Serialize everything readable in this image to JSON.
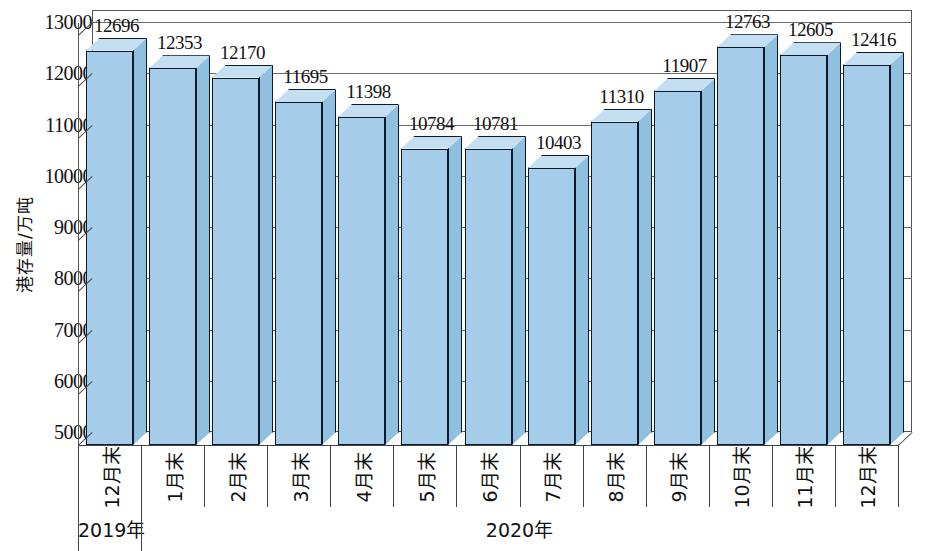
{
  "chart_data": {
    "type": "bar",
    "title": "",
    "xlabel": "",
    "ylabel": "港存量/万吨",
    "ylim": [
      5000,
      13000
    ],
    "ytick_step": 1000,
    "yticks": [
      "13000",
      "12000",
      "11000",
      "10000",
      "9000",
      "8000",
      "7000",
      "6000",
      "5000"
    ],
    "ytick_values": [
      13000,
      12000,
      11000,
      10000,
      9000,
      8000,
      7000,
      6000,
      5000
    ],
    "grid": true,
    "legend": null,
    "legend_position": "none",
    "style": "3d-column",
    "categories": [
      "12月末",
      "1月末",
      "2月末",
      "3月末",
      "4月末",
      "5月末",
      "6月末",
      "7月末",
      "8月末",
      "9月末",
      "10月末",
      "11月末",
      "12月末"
    ],
    "values": [
      12696,
      12353,
      12170,
      11695,
      11398,
      10784,
      10781,
      10403,
      11310,
      11907,
      12763,
      12605,
      12416
    ],
    "data_labels": [
      "12696",
      "12353",
      "12170",
      "11695",
      "11398",
      "10784",
      "10781",
      "10403",
      "11310",
      "11907",
      "12763",
      "12605",
      "12416"
    ],
    "groups": [
      {
        "label": "2019年",
        "start_index": 0,
        "end_index": 0
      },
      {
        "label": "2020年",
        "start_index": 1,
        "end_index": 12
      }
    ],
    "colors": {
      "bar_front": "#a5cde9",
      "bar_side": "#8fc0e0",
      "bar_top": "#c4dff2",
      "bar_outline": "#0d1a2b",
      "gridline": "#6b6b6b",
      "axis": "#555555",
      "background": "#ffffff",
      "text": "#111111"
    }
  }
}
